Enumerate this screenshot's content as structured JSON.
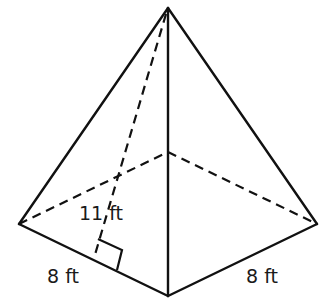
{
  "figure": {
    "type": "square pyramid",
    "labels": {
      "slant_height": "11 ft",
      "base_left_edge": "8 ft",
      "base_right_edge": "8 ft"
    },
    "colors": {
      "stroke": "#111111",
      "background": "#ffffff"
    }
  }
}
